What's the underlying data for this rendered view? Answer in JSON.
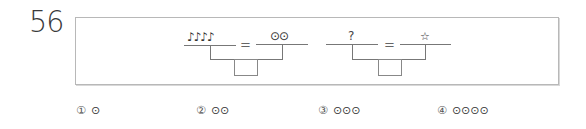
{
  "question": {
    "number": "56"
  },
  "balance_1": {
    "left": "♪♪♪♪",
    "equals": "=",
    "right": "⊙⊙"
  },
  "balance_2": {
    "left": "?",
    "equals": "=",
    "right": "☆"
  },
  "options": [
    {
      "marker": "①",
      "value": "⊙"
    },
    {
      "marker": "②",
      "value": "⊙⊙"
    },
    {
      "marker": "③",
      "value": "⊙⊙⊙"
    },
    {
      "marker": "④",
      "value": "⊙⊙⊙⊙"
    }
  ]
}
